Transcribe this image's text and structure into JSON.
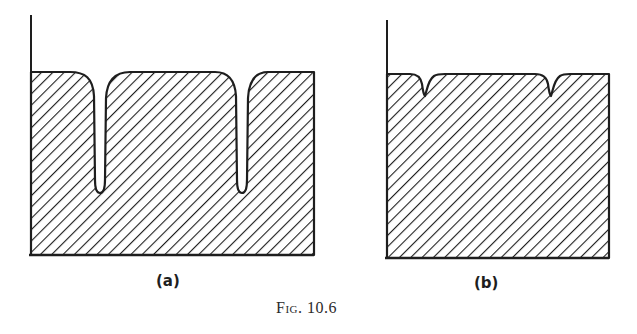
{
  "figure": {
    "caption": "Fig. 10.6",
    "colors": {
      "ink": "#1e1e1e",
      "background": "#ffffff"
    },
    "panels": [
      {
        "id": "a",
        "label": "(a)",
        "description": "Hatched region with a flat top and two deep narrow notches"
      },
      {
        "id": "b",
        "label": "(b)",
        "description": "Hatched region with a flat top and two small shallow notches"
      }
    ]
  }
}
